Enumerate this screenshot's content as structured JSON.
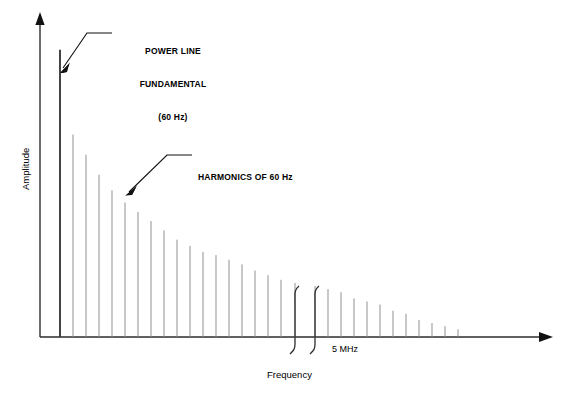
{
  "figure": {
    "type": "spectrum-plot",
    "background_color": "#ffffff",
    "line_color": "#000000",
    "bar_color": "#8a8a8a",
    "fundamental_color": "#3a3a3a"
  },
  "axes": {
    "x_label": "Frequency",
    "y_label": "Amplitude",
    "x_arrow": true,
    "y_arrow": true,
    "break_label": "5 MHz",
    "break_present": true
  },
  "annotations": [
    {
      "name": "power-line-fundamental",
      "lines": [
        "POWER LINE",
        "FUNDAMENTAL",
        "(60 Hz)"
      ],
      "text": "POWER LINE FUNDAMENTAL (60 Hz)"
    },
    {
      "name": "harmonics",
      "lines": [
        "HARMONICS OF 60 Hz"
      ],
      "text": "HARMONICS OF 60 Hz"
    }
  ],
  "chart_data": {
    "type": "bar",
    "title": "",
    "xlabel": "Frequency",
    "ylabel": "Amplitude",
    "grid": false,
    "legend": null,
    "xlim": [
      0,
      562
    ],
    "ylim": [
      0,
      1
    ],
    "annotations": [
      {
        "text": "POWER LINE FUNDAMENTAL (60 Hz)",
        "points_to_x": 60,
        "points_to_y": 0.855
      },
      {
        "text": "HARMONICS OF 60 Hz",
        "points_to_x": 125,
        "points_to_y": 0.49
      },
      {
        "text": "5 MHz",
        "points_to_x": 305,
        "points_to_y": 0.0
      }
    ],
    "categories": [
      "60 Hz fundamental",
      "h2",
      "h3",
      "h4",
      "h5",
      "h6",
      "h7",
      "h8",
      "h9",
      "h10",
      "h11",
      "h12",
      "h13",
      "h14",
      "h15",
      "h16",
      "h17",
      "h18",
      "h19",
      "h20",
      "h21",
      "h22",
      "h23",
      "h24",
      "h25",
      "h26",
      "h27",
      "h28",
      "h29",
      "h30",
      "h31",
      "h32",
      "h33",
      "h34",
      "h35",
      "h36",
      "h37"
    ],
    "values": [
      0.93,
      0.0,
      0.655,
      0.59,
      0.525,
      0.475,
      0.435,
      0.405,
      0.375,
      0.345,
      0.315,
      0.295,
      0.275,
      0.265,
      0.25,
      0.235,
      0.215,
      0.2,
      0.185,
      0.175,
      0.165,
      0.155,
      0.0,
      0.155,
      0.145,
      0.125,
      0.115,
      0.105,
      0.085,
      0.075,
      0.055,
      0.045,
      0.035,
      0.028,
      0.022,
      0.016,
      0.012
    ],
    "bar_x_px": [
      60,
      73,
      86,
      99,
      112,
      125,
      138,
      151,
      164,
      177,
      190,
      203,
      216,
      229,
      242,
      255,
      268,
      281,
      295,
      315,
      328,
      341,
      354,
      367,
      380,
      393,
      406,
      419,
      432,
      445,
      458
    ],
    "bar_values_px": [
      0.93,
      0.655,
      0.59,
      0.525,
      0.475,
      0.435,
      0.405,
      0.375,
      0.345,
      0.315,
      0.295,
      0.275,
      0.265,
      0.25,
      0.235,
      0.215,
      0.2,
      0.185,
      0.175,
      0.165,
      0.155,
      0.145,
      0.125,
      0.115,
      0.105,
      0.085,
      0.075,
      0.055,
      0.045,
      0.035,
      0.025
    ]
  }
}
